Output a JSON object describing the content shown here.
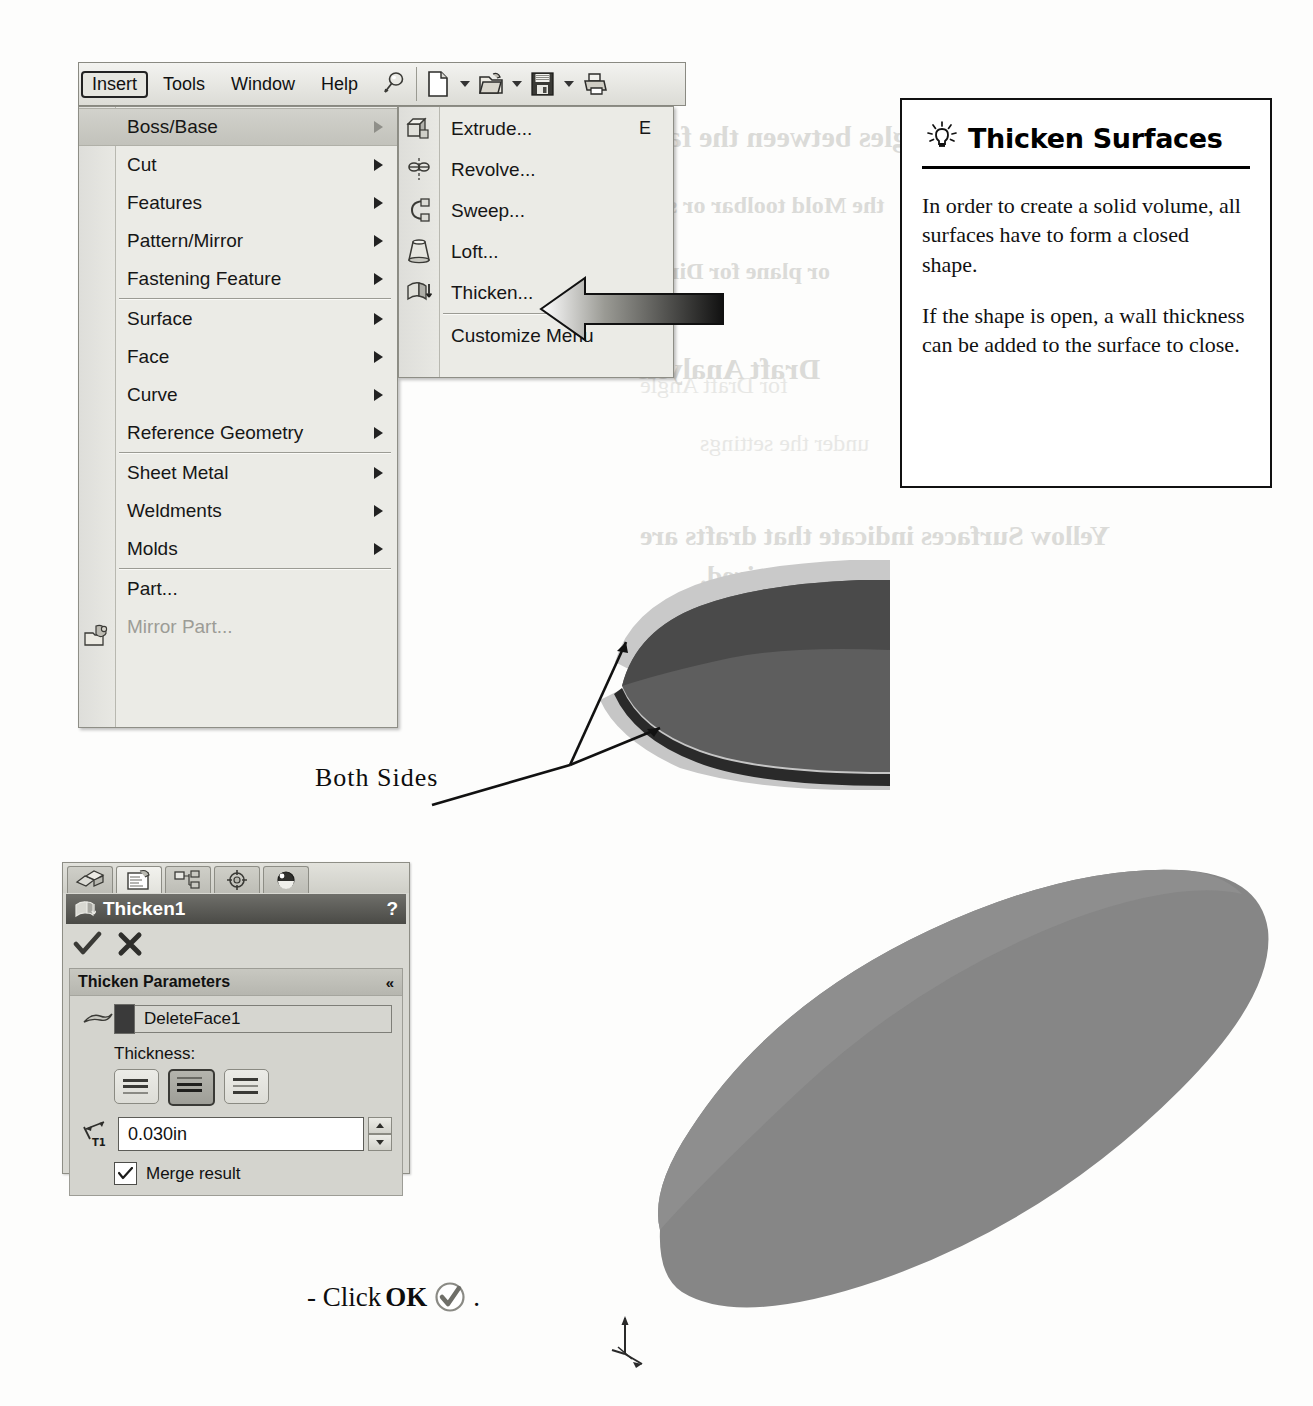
{
  "menubar": {
    "items": [
      {
        "label": "Insert",
        "active": true
      },
      {
        "label": "Tools",
        "active": false
      },
      {
        "label": "Window",
        "active": false
      },
      {
        "label": "Help",
        "active": false
      }
    ],
    "toolbar_icons": [
      "pushpin-icon",
      "new-document-icon",
      "open-folder-icon",
      "save-icon",
      "print-icon"
    ]
  },
  "insert_menu": {
    "groups": [
      [
        {
          "label": "Boss/Base",
          "submenu": true,
          "highlighted": true,
          "disabled": false
        },
        {
          "label": "Cut",
          "submenu": true,
          "highlighted": false,
          "disabled": false
        },
        {
          "label": "Features",
          "submenu": true,
          "highlighted": false,
          "disabled": false
        },
        {
          "label": "Pattern/Mirror",
          "submenu": true,
          "highlighted": false,
          "disabled": false
        },
        {
          "label": "Fastening Feature",
          "submenu": true,
          "highlighted": false,
          "disabled": false
        }
      ],
      [
        {
          "label": "Surface",
          "submenu": true,
          "highlighted": false,
          "disabled": false
        },
        {
          "label": "Face",
          "submenu": true,
          "highlighted": false,
          "disabled": false
        },
        {
          "label": "Curve",
          "submenu": true,
          "highlighted": false,
          "disabled": false
        },
        {
          "label": "Reference Geometry",
          "submenu": true,
          "highlighted": false,
          "disabled": false
        }
      ],
      [
        {
          "label": "Sheet Metal",
          "submenu": true,
          "highlighted": false,
          "disabled": false
        },
        {
          "label": "Weldments",
          "submenu": true,
          "highlighted": false,
          "disabled": false
        },
        {
          "label": "Molds",
          "submenu": true,
          "highlighted": false,
          "disabled": false
        }
      ],
      [
        {
          "label": "Part...",
          "submenu": false,
          "highlighted": false,
          "disabled": false,
          "icon": "insert-part-icon"
        },
        {
          "label": "Mirror Part...",
          "submenu": false,
          "highlighted": false,
          "disabled": true
        }
      ]
    ]
  },
  "boss_base_submenu": {
    "groups": [
      [
        {
          "label": "Extrude...",
          "accel": "E",
          "icon": "extrude-icon"
        },
        {
          "label": "Revolve...",
          "accel": "",
          "icon": "revolve-icon"
        },
        {
          "label": "Sweep...",
          "accel": "",
          "icon": "sweep-icon"
        },
        {
          "label": "Loft...",
          "accel": "",
          "icon": "loft-icon"
        },
        {
          "label": "Thicken...",
          "accel": "",
          "icon": "thicken-icon"
        }
      ],
      [
        {
          "label": "Customize Menu",
          "accel": "",
          "icon": ""
        }
      ]
    ],
    "pointer_target": "Thicken..."
  },
  "tip_box": {
    "icon": "lightbulb-icon",
    "title": "Thicken Surfaces",
    "paragraphs": [
      "In order to create a solid volume, all surfaces have to form a closed shape.",
      "If the shape is open, a wall thickness can be added to the surface to close."
    ]
  },
  "property_manager": {
    "tabs": [
      {
        "name": "feature-manager-tab",
        "active": false
      },
      {
        "name": "property-manager-tab",
        "active": true
      },
      {
        "name": "configuration-manager-tab",
        "active": false
      },
      {
        "name": "dimxpert-manager-tab",
        "active": false
      },
      {
        "name": "display-manager-tab",
        "active": false
      }
    ],
    "title": "Thicken1",
    "help_label": "?",
    "ok_label": "OK",
    "cancel_label": "Cancel",
    "section": {
      "header": "Thicken Parameters",
      "collapse_glyph": "«",
      "selection_value": "DeleteFace1",
      "thickness_label": "Thickness:",
      "thickness_sides": [
        {
          "name": "thicken-side-1",
          "selected": false
        },
        {
          "name": "thicken-side-2",
          "selected": true
        },
        {
          "name": "thicken-side-both",
          "selected": false
        }
      ],
      "thickness_dim_label": "T1",
      "thickness_value": "0.030in",
      "merge_result_label": "Merge result",
      "merge_result_checked": true,
      "check_glyph": "✓"
    }
  },
  "annotations": {
    "both_sides": "Both Sides",
    "click_ok_prefix": "- Click",
    "click_ok_bold": "OK",
    "click_ok_suffix": "."
  },
  "bleed_through": [
    {
      "text": "ngles between the face",
      "x": 640,
      "y": 120,
      "size": 30,
      "light": false
    },
    {
      "text": "the Mold toolbar or sele",
      "x": 640,
      "y": 192,
      "size": 24,
      "light": false
    },
    {
      "text": "or plane for Direct",
      "x": 640,
      "y": 258,
      "size": 24,
      "light": false
    },
    {
      "text": "Draft Analysis",
      "x": 636,
      "y": 352,
      "size": 30,
      "light": false
    },
    {
      "text": "for Draft Angle",
      "x": 640,
      "y": 372,
      "size": 24,
      "light": true
    },
    {
      "text": "under the settings",
      "x": 700,
      "y": 430,
      "size": 24,
      "light": true
    },
    {
      "text": "Yellow Surfaces indicate that drafts are",
      "x": 640,
      "y": 520,
      "size": 28,
      "light": false
    },
    {
      "text": "required.",
      "x": 700,
      "y": 560,
      "size": 28,
      "light": false
    },
    {
      "text": "d angles o",
      "x": 200,
      "y": 540,
      "size": 22,
      "light": true
    },
    {
      "text": "ou can ex",
      "x": 200,
      "y": 568,
      "size": 22,
      "light": true
    },
    {
      "text": "changes withou",
      "x": 200,
      "y": 596,
      "size": 22,
      "light": true
    }
  ]
}
